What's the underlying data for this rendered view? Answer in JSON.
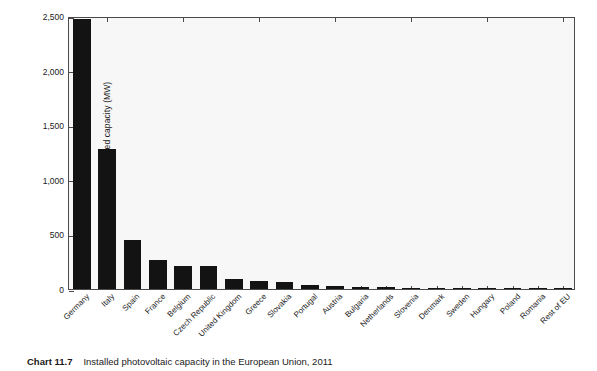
{
  "caption": {
    "label": "Chart 11.7",
    "text": "Installed photovoltaic capacity in the European Union, 2011"
  },
  "chart_data": {
    "type": "bar",
    "title": "",
    "subtitle": "",
    "xlabel": "",
    "ylabel": "Installed capacity (MW)",
    "ylim": [
      0,
      2500
    ],
    "yticks": [
      0,
      500,
      1000,
      1500,
      2000,
      2500
    ],
    "ytick_labels": [
      "0",
      "500",
      "1,000",
      "1,500",
      "2,000",
      "2,500"
    ],
    "grid": false,
    "legend": null,
    "bar_color": "#131313",
    "plot_background": "#f7f7f7",
    "axis_color": "#4a4a4a",
    "categories": [
      "Germany",
      "Italy",
      "Spain",
      "France",
      "Belgium",
      "Czech Republic",
      "United Kingdom",
      "Greece",
      "Slovakia",
      "Portugal",
      "Austria",
      "Bulgaria",
      "Netherlands",
      "Slovenia",
      "Denmark",
      "Sweden",
      "Hungary",
      "Poland",
      "Romania",
      "Rest of EU"
    ],
    "values": [
      2470,
      1280,
      450,
      270,
      215,
      210,
      95,
      73,
      68,
      35,
      28,
      22,
      19,
      12,
      9,
      5,
      3,
      2,
      2,
      8
    ]
  }
}
